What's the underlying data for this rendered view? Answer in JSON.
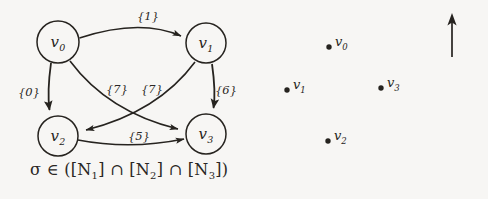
{
  "figure": {
    "background_color": "#f7f6f4",
    "ink_color": "#262320",
    "caption_formula": "σ ∈ ([N1] ∩ [N2] ∩ [N3])"
  },
  "graph": {
    "nodes": [
      {
        "id": "v0",
        "label": "v",
        "sub": "0",
        "cx": 58,
        "cy": 42,
        "r": 21
      },
      {
        "id": "v1",
        "label": "v",
        "sub": "1",
        "cx": 206,
        "cy": 43,
        "r": 20
      },
      {
        "id": "v2",
        "label": "v",
        "sub": "2",
        "cx": 58,
        "cy": 136,
        "r": 20
      },
      {
        "id": "v3",
        "label": "v",
        "sub": "3",
        "cx": 206,
        "cy": 134,
        "r": 20
      }
    ],
    "edges": [
      {
        "id": "e0",
        "from": "v0",
        "to": "v1",
        "label": "{1}",
        "lx": 148,
        "ly": 16
      },
      {
        "id": "e1",
        "from": "v0",
        "to": "v2",
        "label": "{0}",
        "lx": 29,
        "ly": 92
      },
      {
        "id": "e2",
        "from": "v0",
        "to": "v3",
        "label": "{7}",
        "lx": 117,
        "ly": 89
      },
      {
        "id": "e3",
        "from": "v1",
        "to": "v2",
        "label": "{7}",
        "lx": 152,
        "ly": 89
      },
      {
        "id": "e4",
        "from": "v1",
        "to": "v3",
        "label": "{6}",
        "lx": 226,
        "ly": 90
      },
      {
        "id": "e5",
        "from": "v2",
        "to": "v3",
        "label": "{5}",
        "lx": 139,
        "ly": 136
      }
    ]
  },
  "scatter": {
    "points": [
      {
        "id": "p0",
        "label": "v",
        "sub": "0",
        "x": 329,
        "y": 47
      },
      {
        "id": "p1",
        "label": "v",
        "sub": "1",
        "x": 287,
        "y": 90
      },
      {
        "id": "p3",
        "label": "v",
        "sub": "3",
        "x": 381,
        "y": 88
      },
      {
        "id": "p2",
        "label": "v",
        "sub": "2",
        "x": 328,
        "y": 141
      }
    ],
    "arrow": {
      "id": "up-arrow",
      "x": 452,
      "y_top": 15,
      "y_bottom": 57
    }
  }
}
